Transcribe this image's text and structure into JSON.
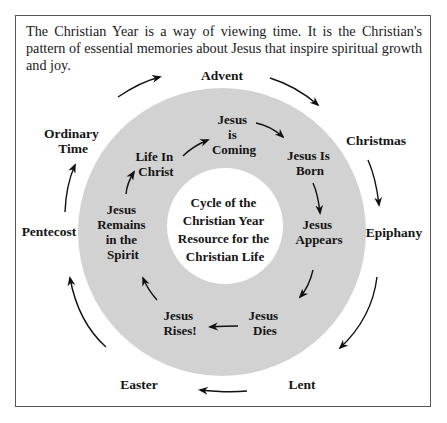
{
  "intro_text": "The Christian Year is a way of viewing time. It is the Christian's pattern of essential memories about Jesus that inspire spiritual growth and joy.",
  "center": {
    "lines": [
      "Cycle of the",
      "Christian Year",
      "Resource for the",
      "Christian Life"
    ]
  },
  "outer_seasons": [
    {
      "name": "advent",
      "lines": [
        "Advent"
      ]
    },
    {
      "name": "christmas",
      "lines": [
        "Christmas"
      ]
    },
    {
      "name": "epiphany",
      "lines": [
        "Epiphany"
      ]
    },
    {
      "name": "lent",
      "lines": [
        "Lent"
      ]
    },
    {
      "name": "easter",
      "lines": [
        "Easter"
      ]
    },
    {
      "name": "pentecost",
      "lines": [
        "Pentecost"
      ]
    },
    {
      "name": "ordinary-time",
      "lines": [
        "Ordinary",
        "Time"
      ]
    }
  ],
  "inner_events": [
    {
      "name": "jesus-is-coming",
      "lines": [
        "Jesus",
        "is",
        "Coming"
      ]
    },
    {
      "name": "jesus-is-born",
      "lines": [
        "Jesus Is",
        "Born"
      ]
    },
    {
      "name": "jesus-appears",
      "lines": [
        "Jesus",
        "Appears"
      ]
    },
    {
      "name": "jesus-dies",
      "lines": [
        "Jesus",
        "Dies"
      ]
    },
    {
      "name": "jesus-rises",
      "lines": [
        "Jesus",
        "Rises!"
      ]
    },
    {
      "name": "jesus-remains-in-the-spirit",
      "lines": [
        "Jesus",
        "Remains",
        "in the",
        "Spirit"
      ]
    },
    {
      "name": "life-in-christ",
      "lines": [
        "Life In",
        "Christ"
      ]
    }
  ],
  "colors": {
    "ring": "#d2d2d2",
    "inner": "#ffffff",
    "text": "#151515",
    "border": "#555555"
  }
}
